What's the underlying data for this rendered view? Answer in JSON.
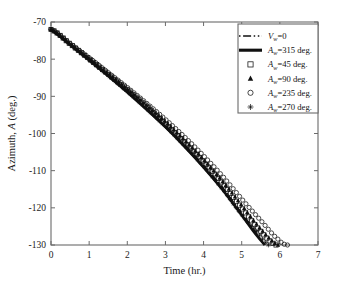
{
  "chart_data": {
    "type": "line",
    "title": "",
    "xlabel": "Time (hr.)",
    "ylabel": "Azimuth, A (deg.)",
    "xlim": [
      0,
      7
    ],
    "ylim": [
      -130,
      -70
    ],
    "xticks": [
      0,
      1,
      2,
      3,
      4,
      5,
      6,
      7
    ],
    "yticks": [
      -70,
      -80,
      -90,
      -100,
      -110,
      -120,
      -130
    ],
    "xticklabels": [
      "0",
      "1",
      "2",
      "3",
      "4",
      "5",
      "6",
      "7"
    ],
    "yticklabels": [
      "-70",
      "-80",
      "-90",
      "-100",
      "-110",
      "-120",
      "-130"
    ],
    "grid": false,
    "legend_position": "upper right",
    "series": [
      {
        "name": "V_w=0",
        "label": "V",
        "sub": "w",
        "suffix": "=0",
        "style": "dashdot",
        "marker": "none",
        "x": [
          0,
          0.5,
          1,
          1.5,
          2,
          2.5,
          3,
          3.5,
          4,
          4.5,
          5,
          5.3,
          5.6
        ],
        "y": [
          -72.0,
          -76.0,
          -80.1,
          -84.3,
          -88.6,
          -93.1,
          -97.9,
          -103.0,
          -108.6,
          -114.6,
          -121.4,
          -125.6,
          -130.0
        ]
      },
      {
        "name": "A_w=315 deg.",
        "label": "A",
        "sub": "w",
        "suffix": "=315 deg.",
        "style": "solid",
        "marker": "none",
        "x": [
          0,
          0.5,
          1,
          1.5,
          2,
          2.5,
          3,
          3.5,
          4,
          4.5,
          5,
          5.3,
          5.6
        ],
        "y": [
          -72.0,
          -76.1,
          -80.3,
          -84.5,
          -88.9,
          -93.5,
          -98.3,
          -103.5,
          -109.1,
          -115.2,
          -122.0,
          -126.2,
          -130.0
        ]
      },
      {
        "name": "A_w=45 deg.",
        "label": "A",
        "sub": "w",
        "suffix": "=45 deg.",
        "style": "markers",
        "marker": "square",
        "x": [
          0,
          0.5,
          1,
          1.5,
          2,
          2.5,
          3,
          3.5,
          4,
          4.5,
          5,
          5.5,
          5.9
        ],
        "y": [
          -72.0,
          -75.9,
          -79.9,
          -84.0,
          -88.2,
          -92.6,
          -97.2,
          -102.2,
          -107.6,
          -113.5,
          -120.0,
          -126.3,
          -130.0
        ]
      },
      {
        "name": "A_w=90 deg.",
        "label": "A",
        "sub": "w",
        "suffix": "=90 deg.",
        "style": "markers",
        "marker": "triangle",
        "x": [
          0,
          0.5,
          1,
          1.5,
          2,
          2.5,
          3,
          3.5,
          4,
          4.5,
          5,
          5.5,
          5.95
        ],
        "y": [
          -72.0,
          -75.9,
          -79.8,
          -83.9,
          -88.0,
          -92.4,
          -96.9,
          -101.8,
          -107.1,
          -112.9,
          -119.3,
          -125.7,
          -130.0
        ]
      },
      {
        "name": "A_w=235 deg.",
        "label": "A",
        "sub": "w",
        "suffix": "=235 deg.",
        "style": "markers",
        "marker": "circle",
        "x": [
          0,
          0.5,
          1,
          1.5,
          2,
          2.5,
          3,
          3.5,
          4,
          4.5,
          5,
          5.5,
          6.0,
          6.2
        ],
        "y": [
          -72.0,
          -75.8,
          -79.6,
          -83.6,
          -87.6,
          -91.8,
          -96.2,
          -100.9,
          -106.0,
          -111.5,
          -117.6,
          -123.4,
          -128.8,
          -130.0
        ]
      },
      {
        "name": "A_w=270 deg.",
        "label": "A",
        "sub": "w",
        "suffix": "=270 deg.",
        "style": "markers",
        "marker": "star",
        "x": [
          0,
          0.5,
          1,
          1.5,
          2,
          2.5,
          3,
          3.5,
          4,
          4.5,
          5,
          5.4,
          5.7
        ],
        "y": [
          -72.0,
          -76.0,
          -80.2,
          -84.4,
          -88.7,
          -93.3,
          -98.1,
          -103.2,
          -108.8,
          -115.0,
          -121.8,
          -126.4,
          -130.0
        ]
      }
    ]
  },
  "legend": {
    "entries": [
      {
        "text": "V",
        "sub": "w",
        "suffix": "=0",
        "sample": "dashdot"
      },
      {
        "text": "A",
        "sub": "w",
        "suffix": "=315 deg.",
        "sample": "solid"
      },
      {
        "text": "A",
        "sub": "w",
        "suffix": "=45 deg.",
        "sample": "square"
      },
      {
        "text": "A",
        "sub": "w",
        "suffix": "=90 deg.",
        "sample": "triangle"
      },
      {
        "text": "A",
        "sub": "w",
        "suffix": "=235 deg.",
        "sample": "circle"
      },
      {
        "text": "A",
        "sub": "w",
        "suffix": "=270 deg.",
        "sample": "star"
      }
    ]
  },
  "axes": {
    "x_title": "Time (hr.)",
    "y_title_main": "Azimuth, ",
    "y_title_italic": "A",
    "y_title_unit": " (deg.)"
  }
}
